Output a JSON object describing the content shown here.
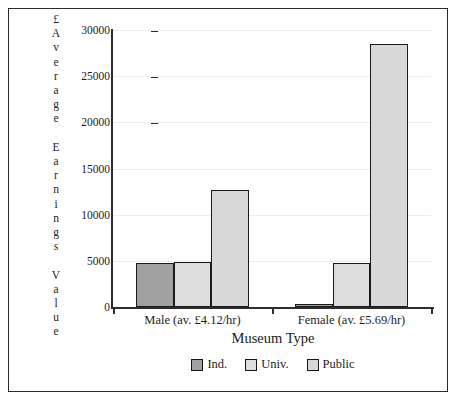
{
  "chart_data": {
    "type": "bar",
    "title": "",
    "xlabel": "Museum Type",
    "ylabel": "£ Average Earnings Value",
    "ylabel_letters": [
      "£",
      "A",
      "v",
      "e",
      "r",
      "a",
      "g",
      "e",
      "",
      "E",
      "a",
      "r",
      "n",
      "i",
      "n",
      "g",
      "s",
      "",
      "V",
      "a",
      "l",
      "u",
      "e"
    ],
    "categories": [
      "Male (av. £4.12/hr)",
      "Female (av. £5.69/hr)"
    ],
    "series": [
      {
        "name": "Ind.",
        "color": "#a0a0a0",
        "values": [
          4750,
          300
        ]
      },
      {
        "name": "Univ.",
        "color": "#dcdcdc",
        "values": [
          4850,
          4800
        ]
      },
      {
        "name": "Public",
        "color": "#d8d8d8",
        "values": [
          12700,
          28500
        ]
      }
    ],
    "yticks": [
      0,
      5000,
      10000,
      15000,
      20000,
      25000,
      30000
    ],
    "ytick_labels": [
      "0",
      "5000",
      "10000",
      "15000",
      "20000",
      "25000",
      "30000"
    ],
    "ylim": [
      0,
      30000
    ],
    "grid": true,
    "legend_position": "bottom",
    "legend_entries": [
      "Ind.",
      "Univ.",
      "Public"
    ],
    "colors": {
      "axis": "#2d2d2d",
      "grid": "#ededed",
      "bar_border": "#1a1a1a",
      "frame": "#2b2b2b",
      "text": "#1c1c1c",
      "background": "#ffffff"
    }
  }
}
